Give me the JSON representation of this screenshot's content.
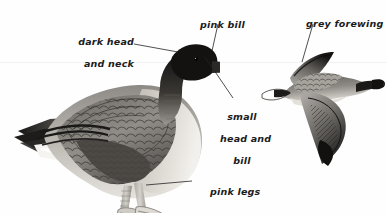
{
  "plate": {
    "title": "Pink-footed Goose identification plate",
    "background_color": "#fefefe",
    "ink_color": "#1b1b1b",
    "horizon_color": "#f2f2f2",
    "width": 387,
    "height": 215
  },
  "annotations": [
    {
      "id": "dark-head-and-neck",
      "line1": "dark head",
      "line2": "and neck",
      "x": 74,
      "y": 26,
      "align": "left",
      "leader": "M 134 44 L 178 52"
    },
    {
      "id": "pink-bill",
      "line1": "pink bill",
      "line2": "",
      "x": 186,
      "y": 9,
      "align": "left",
      "leader": "M 218 24 L 211 52"
    },
    {
      "id": "grey-forewing",
      "line1": "grey forewing",
      "line2": "",
      "x": 294,
      "y": 8,
      "align": "left",
      "leader": "M 313 24 L 303 61"
    },
    {
      "id": "small-head-and-bill",
      "line1": "small",
      "line2": "head and",
      "line3": "bill",
      "x": 218,
      "y": 103,
      "align": "center",
      "leader": "M 205 57 L 232 98"
    },
    {
      "id": "pink-legs",
      "line1": "pink legs",
      "line2": "",
      "x": 196,
      "y": 175,
      "align": "left",
      "leader": "M 192 181 L 146 185"
    }
  ],
  "birds": [
    {
      "id": "standing-goose",
      "name": "standing goose",
      "pose": "standing, facing right",
      "x": 12,
      "y": 35,
      "width": 200,
      "height": 175
    },
    {
      "id": "flying-goose",
      "name": "flying goose",
      "pose": "in flight, facing right",
      "x": 262,
      "y": 45,
      "width": 120,
      "height": 125
    }
  ]
}
